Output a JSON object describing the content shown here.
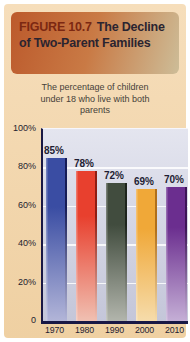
{
  "figure": {
    "label": "FIGURE 10.7",
    "title": "The Decline of Two-Parent Families",
    "subtitle": "The percentage of children under 18 who live with both parents"
  },
  "chart_data": {
    "type": "bar",
    "subtitle": "The percentage of children under 18 who live with both parents",
    "categories": [
      "1970",
      "1980",
      "1990",
      "2000",
      "2010"
    ],
    "values": [
      85,
      78,
      72,
      69,
      70
    ],
    "value_labels": [
      "85%",
      "78%",
      "72%",
      "69%",
      "70%"
    ],
    "xlabel": "",
    "ylabel": "",
    "ylim": [
      0,
      100
    ],
    "y_ticks": [
      "100%",
      "80%",
      "60%",
      "40%",
      "20%",
      "0"
    ],
    "y_tick_values": [
      100,
      80,
      60,
      40,
      20,
      0
    ],
    "grid": true,
    "legend": false,
    "bar_styles": [
      {
        "name": "blue",
        "color": "#3a4da3",
        "fade": "#b2b5d8",
        "edge": "#161c56"
      },
      {
        "name": "red",
        "color": "#e8402e",
        "fade": "#f0c0b2",
        "edge": "#8f1d12"
      },
      {
        "name": "olive",
        "color": "#414c3e",
        "fade": "#b2b5ac",
        "edge": "#1d241c"
      },
      {
        "name": "amber",
        "color": "#f0a838",
        "fade": "#f6dcab",
        "edge": "#b06f1a"
      },
      {
        "name": "purple",
        "color": "#6b2e8f",
        "fade": "#c5afd6",
        "edge": "#3d1456"
      }
    ]
  },
  "colors": {
    "card_background": "#f4d8ae",
    "header_gradient_start": "#bc5a2c",
    "header_gradient_end": "#cdbd98",
    "figure_label_text": "#7c2812",
    "figure_title_text": "#2b2430",
    "plot_background_top": "#e4e5ef",
    "plot_background_bottom": "#c4c6d9",
    "axis_line": "#191845",
    "tick_text": "#23222f",
    "gridline": "#ffffff"
  }
}
